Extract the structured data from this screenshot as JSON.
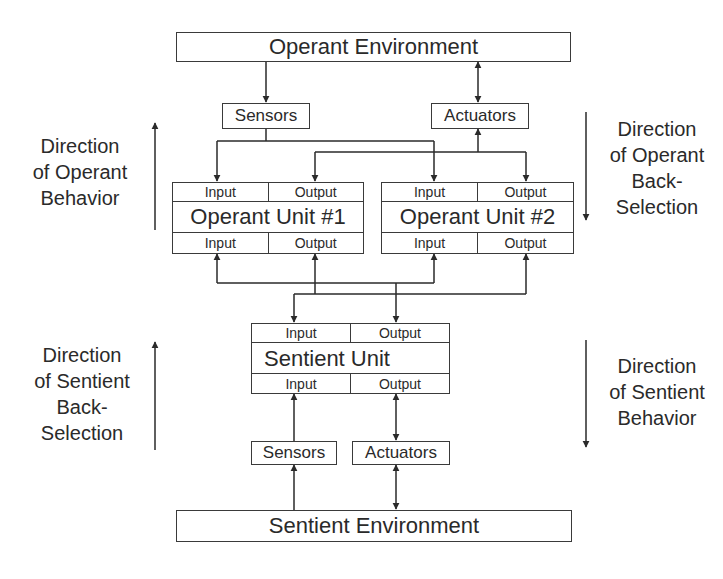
{
  "operant_environment": {
    "label": "Operant Environment"
  },
  "operant_sensors": {
    "label": "Sensors"
  },
  "operant_actuators": {
    "label": "Actuators"
  },
  "operant_units": [
    {
      "title": "Operant Unit #1",
      "top_input": "Input",
      "top_output": "Output",
      "bottom_input": "Input",
      "bottom_output": "Output"
    },
    {
      "title": "Operant Unit #2",
      "top_input": "Input",
      "top_output": "Output",
      "bottom_input": "Input",
      "bottom_output": "Output"
    }
  ],
  "sentient_unit": {
    "title": "Sentient Unit",
    "top_input": "Input",
    "top_output": "Output",
    "bottom_input": "Input",
    "bottom_output": "Output"
  },
  "sentient_sensors": {
    "label": "Sensors"
  },
  "sentient_actuators": {
    "label": "Actuators"
  },
  "sentient_environment": {
    "label": "Sentient Environment"
  },
  "side_labels": {
    "operant_behavior": [
      "Direction",
      "of Operant",
      "Behavior"
    ],
    "operant_back_selection": [
      "Direction",
      "of Operant",
      "Back-",
      "Selection"
    ],
    "sentient_back_selection": [
      "Direction",
      "of Sentient",
      "Back-",
      "Selection"
    ],
    "sentient_behavior": [
      "Direction",
      "of Sentient",
      "Behavior"
    ]
  },
  "colors": {
    "line": "#2a2a2a",
    "background": "#ffffff"
  }
}
